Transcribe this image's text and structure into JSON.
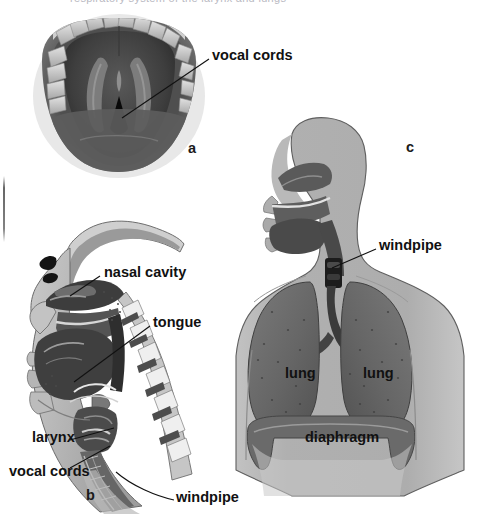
{
  "figure": {
    "title_sliver": "respiratory system of the larynx and lungs",
    "background_color": "#ffffff",
    "width": 482,
    "height": 528
  },
  "panels": [
    {
      "key": "a",
      "letter": "a",
      "caption": "a",
      "kind": "photograph",
      "description": "laryngoscopic view of the vocal cords",
      "labels": [
        {
          "name": "vocal-cords",
          "text": "vocal cords",
          "x": 212,
          "y": 55
        }
      ]
    },
    {
      "key": "b",
      "letter": "b",
      "caption": "b",
      "kind": "sagittal-section-illustration",
      "description": "side cut-away of head, nose, mouth and throat",
      "labels": [
        {
          "name": "nasal-cavity",
          "text": "nasal cavity",
          "x": 104,
          "y": 272
        },
        {
          "name": "tongue",
          "text": "tongue",
          "x": 153,
          "y": 322
        },
        {
          "name": "larynx",
          "text": "larynx",
          "x": 34,
          "y": 437
        },
        {
          "name": "vocal-cords",
          "text": "vocal cords",
          "x": 10,
          "y": 471
        },
        {
          "name": "windpipe",
          "text": "windpipe",
          "x": 176,
          "y": 497
        }
      ]
    },
    {
      "key": "c",
      "letter": "c",
      "caption": "c",
      "kind": "torso-illustration",
      "description": "front view of head and chest showing windpipe, lungs and diaphragm",
      "labels": [
        {
          "name": "windpipe",
          "text": "windpipe",
          "x": 379,
          "y": 245
        },
        {
          "name": "lung-left",
          "text": "lung",
          "x": 285,
          "y": 373
        },
        {
          "name": "lung-right",
          "text": "lung",
          "x": 363,
          "y": 373
        },
        {
          "name": "diaphragm",
          "text": "diaphragm",
          "x": 305,
          "y": 437
        }
      ]
    }
  ],
  "colors": {
    "ink": "#111111",
    "skin_light": "#b3b3b3",
    "skin_mid": "#9a9a9a",
    "airway_dark": "#5e5e5e",
    "lung_dark": "#6d6d6d",
    "lung_darker": "#5a5a5a",
    "tissue_deep": "#3a3a3a",
    "cartilage_light": "#d9d9d9",
    "tooth": "#cfcfcf",
    "photo_dark": "#4a4a4a",
    "photo_darkest": "#1d1d1d"
  },
  "panel_letters": {
    "a": {
      "x": 188,
      "y": 147
    },
    "b": {
      "x": 86,
      "y": 494
    },
    "c": {
      "x": 406,
      "y": 146
    }
  }
}
